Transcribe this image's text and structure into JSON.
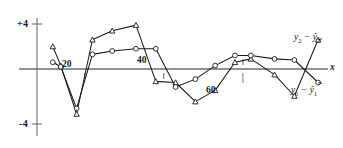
{
  "chart_data": {
    "type": "line",
    "title": "",
    "subtitle": "",
    "xlabel": "x",
    "ylabel": "",
    "grid": false,
    "legend_position": "right-inline",
    "xlim": [
      8,
      82
    ],
    "ylim": [
      -5.2,
      5.2
    ],
    "yticks": [
      4,
      -4
    ],
    "ytick_labels": [
      "+4",
      "-4"
    ],
    "xticks": [
      20,
      40,
      60
    ],
    "xtick_labels": [
      "20",
      "40",
      "60"
    ],
    "annotations": [
      {
        "text": "x",
        "role": "axis-name",
        "position": "axis-end-right"
      }
    ],
    "series": [
      {
        "name": "y₂ − ŷ₂",
        "name_base": "y",
        "name_sub": "2",
        "marker": "triangle",
        "color": "#1a1a1a",
        "x": [
          12,
          14,
          18,
          22,
          27,
          33,
          38,
          43,
          48,
          53,
          58,
          62,
          68,
          73,
          79
        ],
        "y": [
          2.0,
          0.3,
          -4.0,
          2.6,
          3.4,
          3.9,
          -1.1,
          -1.2,
          -2.9,
          -1.9,
          0.6,
          0.9,
          -0.5,
          -2.4,
          2.6
        ]
      },
      {
        "name": "y₁ − ŷ₁",
        "name_base": "y",
        "name_sub": "1",
        "marker": "circle",
        "color": "#1a1a1a",
        "x": [
          12,
          14,
          18,
          22,
          27,
          33,
          38,
          43,
          48,
          53,
          58,
          62,
          68,
          73,
          79
        ],
        "y": [
          0.6,
          0.2,
          -3.5,
          1.3,
          1.6,
          1.8,
          1.8,
          -1.6,
          -0.9,
          0.3,
          1.2,
          1.2,
          0.9,
          0.8,
          -1.2
        ]
      }
    ]
  },
  "labels": {
    "y_top": "+4",
    "y_bottom": "-4",
    "x_20": "20",
    "x_40": "40",
    "x_60": "60",
    "axis_x": "x",
    "series2_pre": "y",
    "series2_sub": "2",
    "series2_minus": "−",
    "series2_hat": "ŷ",
    "series2_hat_sub": "2",
    "series1_pre": "y",
    "series1_sub": "1",
    "series1_minus": "−",
    "series1_hat": "ŷ",
    "series1_hat_sub": "1"
  },
  "style": {
    "ink": "#2a2a2a",
    "axis": "#6f6f6f",
    "background": "#ffffff"
  }
}
